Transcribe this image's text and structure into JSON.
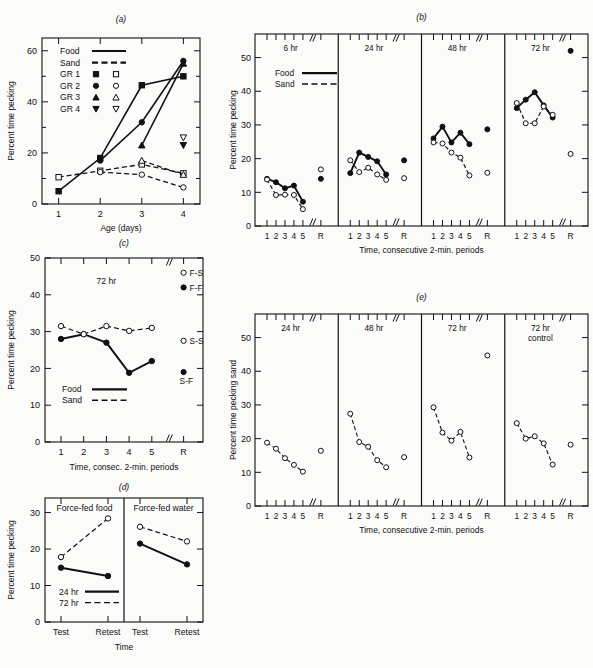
{
  "figure": {
    "panels": [
      "a",
      "b",
      "c",
      "d",
      "e"
    ],
    "ylabel_percent": "Percent time pecking",
    "ylabel_sand": "Percent time pecking sand",
    "xlabel_time_periods": "Time, consecutive 2-min. periods",
    "xlabel_consec": "Time, consec. 2-min. periods",
    "xlabel_age": "Age (days)",
    "xlabel_time": "Time"
  },
  "panel_a": {
    "label": "(a)",
    "xlabel": "Age (days)",
    "ylabel": "Percent time pecking",
    "xticks": [
      "1",
      "2",
      "3",
      "4"
    ],
    "yticks": [
      "0",
      "20",
      "40",
      "60"
    ],
    "ylim": [
      0,
      65
    ],
    "legend": [
      {
        "label": "Food",
        "style": "solid-line"
      },
      {
        "label": "Sand",
        "style": "dashed-line"
      },
      {
        "label": "GR 1",
        "filled": "square",
        "open": "square"
      },
      {
        "label": "GR 2",
        "filled": "circle",
        "open": "circle"
      },
      {
        "label": "GR 3",
        "filled": "triangle-up",
        "open": "triangle-up"
      },
      {
        "label": "GR 4",
        "filled": "triangle-down",
        "open": "triangle-down"
      }
    ],
    "chart_data": {
      "type": "line",
      "title": "(a)",
      "xlabel": "Age (days)",
      "ylabel": "Percent time pecking",
      "x": [
        1,
        2,
        3,
        4
      ],
      "xlim": [
        0.6,
        4.4
      ],
      "ylim": [
        0,
        65
      ],
      "grid": false,
      "series": [
        {
          "name": "GR 1 food",
          "marker": "square-filled",
          "line": "solid",
          "x": [
            1,
            2,
            3,
            4
          ],
          "values": [
            5.0,
            18.0,
            46.5,
            50.0
          ]
        },
        {
          "name": "GR 2 food",
          "marker": "circle-filled",
          "line": "solid",
          "x": [
            2,
            3,
            4
          ],
          "values": [
            17.0,
            32.0,
            56.0
          ]
        },
        {
          "name": "GR 3 food",
          "marker": "triangle-up-filled",
          "line": "solid",
          "x": [
            3,
            4
          ],
          "values": [
            23.0,
            55.0
          ]
        },
        {
          "name": "GR 4 food",
          "marker": "triangle-down-filled",
          "line": "none",
          "x": [
            4
          ],
          "values": [
            23.0
          ]
        },
        {
          "name": "GR 1 sand",
          "marker": "square-open",
          "line": "dashed",
          "x": [
            1,
            2,
            3,
            4
          ],
          "values": [
            10.5,
            13.0,
            15.5,
            12.0
          ]
        },
        {
          "name": "GR 2 sand",
          "marker": "circle-open",
          "line": "dashed",
          "x": [
            2,
            3,
            4
          ],
          "values": [
            12.5,
            11.5,
            6.5
          ]
        },
        {
          "name": "GR 3 sand",
          "marker": "triangle-up-open",
          "line": "dashed",
          "x": [
            3,
            4
          ],
          "values": [
            17.0,
            11.5
          ]
        },
        {
          "name": "GR 4 sand",
          "marker": "triangle-down-open",
          "line": "none",
          "x": [
            4
          ],
          "values": [
            26.0
          ]
        }
      ]
    }
  },
  "panel_b": {
    "label": "(b)",
    "xlabel": "Time, consecutive 2-min. periods",
    "ylabel": "Percent time pecking",
    "yticks": [
      "0",
      "10",
      "20",
      "30",
      "40",
      "50"
    ],
    "ylim": [
      0,
      57
    ],
    "xticks": [
      "1",
      "2",
      "3",
      "4",
      "5",
      "R"
    ],
    "legend": [
      {
        "label": "Food",
        "style": "solid-line"
      },
      {
        "label": "Sand",
        "style": "dashed-line"
      }
    ],
    "subpanels": [
      {
        "header": "6 hr"
      },
      {
        "header": "24 hr"
      },
      {
        "header": "48 hr"
      },
      {
        "header": "72 hr"
      }
    ],
    "chart_data": {
      "type": "line",
      "title": "(b)",
      "xlabel": "Time, consecutive 2-min. periods",
      "ylabel": "Percent time pecking",
      "categories": [
        "1",
        "2",
        "3",
        "4",
        "5",
        "R"
      ],
      "ylim": [
        0,
        57
      ],
      "grid": false,
      "panels": [
        {
          "header": "6 hr",
          "series": [
            {
              "name": "Food",
              "line": "solid",
              "marker": "circle-filled",
              "values": [
                14.0,
                13.0,
                11.2,
                12.0,
                7.2
              ],
              "R": 14.0
            },
            {
              "name": "Sand",
              "line": "dashed",
              "marker": "circle-open",
              "values": [
                13.8,
                9.2,
                9.3,
                9.2,
                5.0
              ],
              "R": 16.8
            }
          ]
        },
        {
          "header": "24 hr",
          "series": [
            {
              "name": "Food",
              "line": "solid",
              "marker": "circle-filled",
              "values": [
                15.7,
                21.8,
                20.5,
                19.2,
                15.3
              ],
              "R": 19.5
            },
            {
              "name": "Sand",
              "line": "dashed",
              "marker": "circle-open",
              "values": [
                19.5,
                16.0,
                17.3,
                15.3,
                13.7
              ],
              "R": 14.2
            }
          ]
        },
        {
          "header": "48 hr",
          "series": [
            {
              "name": "Food",
              "line": "solid",
              "marker": "circle-filled",
              "values": [
                26.0,
                29.5,
                24.8,
                27.7,
                24.3
              ],
              "R": 28.7
            },
            {
              "name": "Sand",
              "line": "dashed",
              "marker": "circle-open",
              "values": [
                24.8,
                24.5,
                21.8,
                20.3,
                15.0
              ],
              "R": 15.8
            }
          ]
        },
        {
          "header": "72 hr",
          "series": [
            {
              "name": "Food",
              "line": "solid",
              "marker": "circle-filled",
              "values": [
                35.0,
                37.5,
                39.7,
                35.8,
                32.2
              ],
              "R": 52.0
            },
            {
              "name": "Sand",
              "line": "dashed",
              "marker": "circle-open",
              "values": [
                36.5,
                30.5,
                30.5,
                35.5,
                33.0
              ],
              "R": 21.4
            }
          ]
        }
      ]
    }
  },
  "panel_c": {
    "label": "(c)",
    "xlabel": "Time, consec. 2-min. periods",
    "ylabel": "Percent time pecking",
    "yticks": [
      "0",
      "10",
      "20",
      "30",
      "40",
      "50"
    ],
    "ylim": [
      0,
      50
    ],
    "xticks": [
      "1",
      "2",
      "3",
      "4",
      "5",
      "R"
    ],
    "header": "72 hr",
    "legend": [
      {
        "label": "Food",
        "style": "solid-line"
      },
      {
        "label": "Sand",
        "style": "dashed-line"
      }
    ],
    "annotations": [
      {
        "label": "F-S",
        "marker": "circle-open",
        "value": 46.0
      },
      {
        "label": "F-F",
        "marker": "circle-filled",
        "value": 42.0
      },
      {
        "label": "S-S",
        "marker": "circle-open",
        "value": 27.5
      },
      {
        "label": "S-F",
        "marker": "circle-filled",
        "value": 19.0
      }
    ],
    "chart_data": {
      "type": "line",
      "title": "(c)",
      "xlabel": "Time, consec. 2-min. periods",
      "ylabel": "Percent time pecking",
      "categories": [
        "1",
        "2",
        "3",
        "4",
        "5",
        "R"
      ],
      "ylim": [
        0,
        50
      ],
      "grid": false,
      "header": "72 hr",
      "series": [
        {
          "name": "Food",
          "line": "solid",
          "marker": "circle-filled",
          "values": [
            28.0,
            29.3,
            27.0,
            18.8,
            22.0
          ]
        },
        {
          "name": "Sand",
          "line": "dashed",
          "marker": "circle-open",
          "values": [
            31.5,
            29.3,
            31.5,
            30.2,
            31.0
          ]
        }
      ],
      "R_points": [
        {
          "name": "F-S",
          "marker": "circle-open",
          "value": 46.0
        },
        {
          "name": "F-F",
          "marker": "circle-filled",
          "value": 42.0
        },
        {
          "name": "S-S",
          "marker": "circle-open",
          "value": 27.5
        },
        {
          "name": "S-F",
          "marker": "circle-filled",
          "value": 19.0
        }
      ]
    }
  },
  "panel_d": {
    "label": "(d)",
    "xlabel": "Time",
    "ylabel": "Percent time pecking",
    "yticks": [
      "0",
      "10",
      "20",
      "30"
    ],
    "ylim": [
      0,
      34
    ],
    "xticks": [
      "Test",
      "Retest"
    ],
    "subpanels": [
      {
        "header": "Force-fed food"
      },
      {
        "header": "Force-fed water"
      }
    ],
    "legend": [
      {
        "label": "24 hr",
        "style": "solid-line"
      },
      {
        "label": "72 hr",
        "style": "dashed-line"
      }
    ],
    "chart_data": {
      "type": "line",
      "title": "(d)",
      "xlabel": "Time",
      "ylabel": "Percent time pecking",
      "categories": [
        "Test",
        "Retest"
      ],
      "ylim": [
        0,
        34
      ],
      "grid": false,
      "panels": [
        {
          "header": "Force-fed food",
          "series": [
            {
              "name": "24 hr",
              "line": "solid",
              "marker": "circle-filled",
              "values": [
                14.9,
                12.6
              ]
            },
            {
              "name": "72 hr",
              "line": "dashed",
              "marker": "circle-open",
              "values": [
                17.8,
                28.4
              ]
            }
          ]
        },
        {
          "header": "Force-fed water",
          "series": [
            {
              "name": "24 hr",
              "line": "solid",
              "marker": "circle-filled",
              "values": [
                21.5,
                15.8
              ]
            },
            {
              "name": "72 hr",
              "line": "dashed",
              "marker": "circle-open",
              "values": [
                26.1,
                22.1
              ]
            }
          ]
        }
      ]
    }
  },
  "panel_e": {
    "label": "(e)",
    "xlabel": "Time, consecutive 2-min. periods",
    "ylabel": "Percent time pecking sand",
    "yticks": [
      "0",
      "10",
      "20",
      "30",
      "40",
      "50"
    ],
    "ylim": [
      0,
      57
    ],
    "xticks": [
      "1",
      "2",
      "3",
      "4",
      "5",
      "R"
    ],
    "subpanels": [
      {
        "header": "24 hr"
      },
      {
        "header": "48 hr"
      },
      {
        "header": "72 hr"
      },
      {
        "header": "72 hr",
        "header2": "control"
      }
    ],
    "chart_data": {
      "type": "line",
      "title": "(e)",
      "xlabel": "Time, consecutive 2-min. periods",
      "ylabel": "Percent time pecking sand",
      "categories": [
        "1",
        "2",
        "3",
        "4",
        "5",
        "R"
      ],
      "ylim": [
        0,
        57
      ],
      "grid": false,
      "panels": [
        {
          "header": "24 hr",
          "series": [
            {
              "name": "Sand",
              "line": "dashed",
              "marker": "circle-open",
              "values": [
                18.8,
                17.0,
                14.2,
                12.2,
                10.2
              ],
              "R": 16.4
            }
          ]
        },
        {
          "header": "48 hr",
          "series": [
            {
              "name": "Sand",
              "line": "dashed",
              "marker": "circle-open",
              "values": [
                27.4,
                19.0,
                17.6,
                13.6,
                11.5
              ],
              "R": 14.5
            }
          ]
        },
        {
          "header": "72 hr",
          "series": [
            {
              "name": "Sand",
              "line": "dashed",
              "marker": "circle-open",
              "values": [
                29.3,
                21.8,
                19.4,
                22.0,
                14.4
              ],
              "R": 44.7
            }
          ]
        },
        {
          "header": "72 hr control",
          "series": [
            {
              "name": "Sand",
              "line": "dashed",
              "marker": "circle-open",
              "values": [
                24.6,
                20.0,
                20.7,
                18.6,
                12.3
              ],
              "R": 18.2
            }
          ]
        }
      ]
    }
  }
}
